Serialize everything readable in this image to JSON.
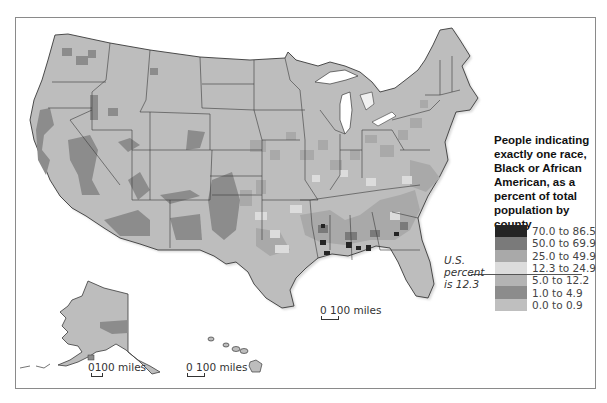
{
  "legend": {
    "title": "People indicating exactly one race, Black or African American, as a percent of total population by county",
    "title_lines": [
      "People indicating",
      "exactly one race,",
      "Black or African",
      "American, as a",
      "percent of total",
      "population by",
      "county"
    ],
    "items": [
      {
        "label": "70.0 to 86.5",
        "color": "#242424"
      },
      {
        "label": "50.0 to 69.9",
        "color": "#7a7a7a"
      },
      {
        "label": "25.0 to 49.9",
        "color": "#a9a9a9"
      },
      {
        "label": "12.3 to 24.9",
        "color": "#dcdcdc"
      },
      {
        "label": "5.0 to 12.2",
        "color": "#b4b4b4"
      },
      {
        "label": "1.0 to 4.9",
        "color": "#8c8c8c"
      },
      {
        "label": "0.0 to 0.9",
        "color": "#bfbfbf"
      }
    ],
    "us_note_lines": [
      "U.S.",
      "percent",
      "is 12.3"
    ],
    "us_percent": 12.3
  },
  "scales": {
    "conus": {
      "zero": "0",
      "label": "100 miles"
    },
    "alaska": {
      "zero": "0",
      "label": "100 miles"
    },
    "hawaii": {
      "zero": "0",
      "label": "100 miles"
    }
  },
  "map": {
    "base_color": "#bdbdbd",
    "border_color": "#3a3a3a",
    "regions": [
      "Contiguous United States",
      "Alaska",
      "Hawaii"
    ]
  }
}
